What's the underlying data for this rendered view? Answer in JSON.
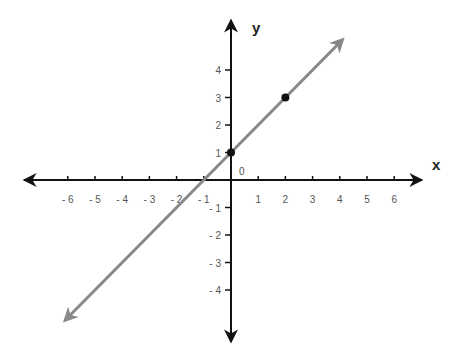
{
  "chart_data": {
    "type": "line",
    "title": "",
    "xlabel": "x",
    "ylabel": "y",
    "origin_label": "0",
    "xlim": [
      -7.5,
      7.5
    ],
    "ylim": [
      -5.5,
      5.5
    ],
    "x_ticks": [
      -6,
      -5,
      -4,
      -3,
      -2,
      -1,
      1,
      2,
      3,
      4,
      5,
      6
    ],
    "x_tick_labels": [
      "- 6",
      "- 5",
      "- 4",
      "- 3",
      "- 2",
      "- 1",
      "1",
      "2",
      "3",
      "4",
      "5",
      "6"
    ],
    "y_ticks": [
      4,
      3,
      2,
      1,
      -1,
      -2,
      -3,
      -4
    ],
    "y_tick_labels": [
      "4",
      "3",
      "2",
      "1",
      "- 1",
      "- 2",
      "- 3",
      "- 4"
    ],
    "grid": false,
    "series": [
      {
        "name": "line",
        "equation": "y = x + 1",
        "slope": 1,
        "intercept": 1,
        "x_range": [
          -6.1,
          4.1
        ],
        "color": "#888888",
        "arrows": "both"
      }
    ],
    "points": [
      {
        "x": 0,
        "y": 1
      },
      {
        "x": 2,
        "y": 3
      }
    ]
  },
  "colors": {
    "axis": "#111111",
    "line": "#888888",
    "point": "#111111",
    "tick_label": "#555555"
  }
}
